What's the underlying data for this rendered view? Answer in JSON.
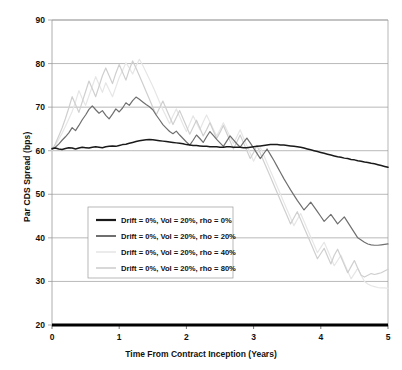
{
  "title": "",
  "axes": {
    "ylabel": "Par CDS Spread (bps)",
    "xlabel": "Time From Contract Inception (Years)",
    "yticks": [
      "90",
      "80",
      "70",
      "60",
      "50",
      "40",
      "30",
      "20"
    ],
    "xticks": [
      "0",
      "1",
      "2",
      "3",
      "4",
      "5"
    ]
  },
  "legend": {
    "items": [
      {
        "label": "Drift = 0%, Vol = 20%, rho = 0%",
        "color": "#1a1a1a"
      },
      {
        "label": "Drift = 0%, Vol = 20%, rho = 20%",
        "color": "#6f6f6f"
      },
      {
        "label": "Drift = 0%, Vol = 20%, rho = 40%",
        "color": "#e6e6e6"
      },
      {
        "label": "Drift = 0%, Vol = 20%, rho = 80%",
        "color": "#cfcfcf"
      }
    ]
  },
  "colors": {
    "grid": "#9a9a9a",
    "frame": "#9a9a9a",
    "axis": "#000000",
    "legend_border": "#9a9a9a",
    "background": "#ffffff"
  },
  "chart_data": {
    "type": "line",
    "title": "",
    "xlabel": "Time From Contract Inception (Years)",
    "ylabel": "Par CDS Spread (bps)",
    "xlim": [
      0,
      5
    ],
    "ylim": [
      20,
      90
    ],
    "grid": true,
    "legend_position": "center-left",
    "x": [
      0,
      0.05,
      0.1,
      0.15,
      0.2,
      0.25,
      0.3,
      0.35,
      0.4,
      0.45,
      0.5,
      0.55,
      0.6,
      0.65,
      0.7,
      0.75,
      0.8,
      0.85,
      0.9,
      0.95,
      1,
      1.05,
      1.1,
      1.15,
      1.2,
      1.25,
      1.3,
      1.35,
      1.4,
      1.45,
      1.5,
      1.55,
      1.6,
      1.65,
      1.7,
      1.75,
      1.8,
      1.85,
      1.9,
      1.95,
      2,
      2.05,
      2.1,
      2.15,
      2.2,
      2.25,
      2.3,
      2.35,
      2.4,
      2.45,
      2.5,
      2.55,
      2.6,
      2.65,
      2.7,
      2.75,
      2.8,
      2.85,
      2.9,
      2.95,
      3,
      3.05,
      3.1,
      3.15,
      3.2,
      3.25,
      3.3,
      3.35,
      3.4,
      3.45,
      3.5,
      3.55,
      3.6,
      3.65,
      3.7,
      3.75,
      3.8,
      3.85,
      3.9,
      3.95,
      4,
      4.05,
      4.1,
      4.15,
      4.2,
      4.25,
      4.3,
      4.35,
      4.4,
      4.45,
      4.5,
      4.55,
      4.6,
      4.65,
      4.7,
      4.75,
      4.8,
      4.85,
      4.9,
      4.95,
      5
    ],
    "series": [
      {
        "name": "Drift = 0%, Vol = 20%, rho = 0%",
        "color": "#1a1a1a",
        "values": [
          60.5,
          60.6,
          60.4,
          60.3,
          60.5,
          60.7,
          60.6,
          60.4,
          60.6,
          60.8,
          60.7,
          60.6,
          60.8,
          60.9,
          60.8,
          60.7,
          60.9,
          61.0,
          61.1,
          61.0,
          61.2,
          61.4,
          61.5,
          61.7,
          61.9,
          62.1,
          62.3,
          62.4,
          62.5,
          62.6,
          62.5,
          62.4,
          62.3,
          62.2,
          62.1,
          62.0,
          61.9,
          61.8,
          61.7,
          61.6,
          61.4,
          61.3,
          61.2,
          61.2,
          61.1,
          61.0,
          61.0,
          60.9,
          60.9,
          60.9,
          60.8,
          60.8,
          60.9,
          60.9,
          60.8,
          60.8,
          60.8,
          60.7,
          60.7,
          60.8,
          60.9,
          61.0,
          61.1,
          61.2,
          61.3,
          61.4,
          61.4,
          61.4,
          61.3,
          61.3,
          61.2,
          61.1,
          61.0,
          60.9,
          60.8,
          60.6,
          60.4,
          60.2,
          60.0,
          59.8,
          59.6,
          59.4,
          59.2,
          59.0,
          58.8,
          58.6,
          58.5,
          58.3,
          58.2,
          58.0,
          57.9,
          57.7,
          57.6,
          57.4,
          57.3,
          57.1,
          57.0,
          56.8,
          56.6,
          56.4,
          56.2
        ]
      },
      {
        "name": "Drift = 0%, Vol = 20%, rho = 20%",
        "color": "#6f6f6f",
        "values": [
          60.3,
          60.8,
          61.5,
          62.4,
          63.2,
          64.1,
          65.3,
          64.6,
          65.8,
          67.1,
          68.2,
          69.5,
          70.3,
          69.4,
          68.6,
          69.2,
          68.1,
          67.3,
          68.4,
          69.6,
          68.9,
          69.8,
          71.0,
          70.4,
          71.5,
          72.3,
          71.8,
          71.2,
          70.6,
          70.1,
          69.4,
          68.2,
          67.1,
          66.0,
          65.2,
          64.4,
          63.9,
          64.5,
          63.6,
          62.8,
          62.0,
          61.3,
          62.4,
          63.6,
          62.8,
          61.9,
          63.2,
          64.4,
          63.5,
          62.6,
          61.8,
          61.0,
          62.2,
          63.4,
          62.5,
          61.6,
          60.8,
          61.9,
          62.9,
          61.8,
          60.6,
          59.4,
          58.2,
          59.3,
          60.4,
          59.1,
          57.8,
          56.4,
          55.0,
          53.6,
          52.3,
          51.0,
          49.8,
          48.6,
          47.5,
          46.4,
          47.3,
          48.2,
          47.1,
          46.0,
          44.9,
          43.8,
          44.6,
          45.4,
          44.3,
          43.2,
          44.0,
          44.8,
          43.6,
          42.4,
          41.2,
          40.0,
          39.5,
          39.0,
          38.6,
          38.4,
          38.3,
          38.3,
          38.4,
          38.5,
          38.6
        ]
      },
      {
        "name": "Drift = 0%, Vol = 20%, rho = 40%",
        "color": "#e6e6e6",
        "values": [
          60.0,
          61.2,
          62.6,
          64.0,
          65.6,
          67.3,
          69.0,
          71.2,
          73.8,
          72.0,
          70.4,
          72.6,
          74.8,
          77.0,
          75.2,
          73.4,
          75.6,
          74.0,
          72.4,
          74.6,
          76.8,
          78.4,
          80.2,
          79.0,
          77.6,
          79.4,
          81.0,
          79.6,
          78.0,
          76.4,
          74.8,
          73.0,
          71.2,
          69.4,
          67.8,
          66.2,
          68.0,
          69.6,
          67.8,
          66.0,
          64.4,
          66.2,
          68.0,
          66.4,
          64.8,
          66.6,
          68.2,
          66.6,
          65.0,
          63.4,
          64.8,
          66.4,
          64.8,
          63.2,
          61.6,
          63.2,
          64.8,
          63.0,
          61.2,
          59.4,
          57.6,
          59.2,
          60.8,
          59.0,
          57.2,
          55.4,
          53.6,
          51.8,
          50.0,
          48.2,
          46.4,
          44.6,
          42.8,
          44.2,
          45.6,
          43.8,
          42.0,
          40.2,
          38.4,
          36.6,
          37.8,
          39.0,
          37.2,
          35.4,
          33.6,
          34.8,
          36.0,
          34.2,
          32.4,
          30.6,
          31.8,
          33.0,
          31.4,
          30.0,
          29.4,
          29.0,
          28.8,
          28.6,
          28.5,
          28.5,
          28.4
        ]
      },
      {
        "name": "Drift = 0%, Vol = 20%, rho = 80%",
        "color": "#cfcfcf",
        "values": [
          60.1,
          61.6,
          63.4,
          65.2,
          67.4,
          69.8,
          72.4,
          70.6,
          68.8,
          71.2,
          73.6,
          76.0,
          74.2,
          72.4,
          74.8,
          77.2,
          79.0,
          77.2,
          75.4,
          77.8,
          79.8,
          78.0,
          76.2,
          78.6,
          80.6,
          79.0,
          77.2,
          75.4,
          73.6,
          71.8,
          70.0,
          68.2,
          69.8,
          71.4,
          69.6,
          67.8,
          66.0,
          67.6,
          69.2,
          67.4,
          65.6,
          63.8,
          65.4,
          67.0,
          65.2,
          63.4,
          64.8,
          66.4,
          64.6,
          62.8,
          64.2,
          65.8,
          64.0,
          62.2,
          60.4,
          62.0,
          63.6,
          61.8,
          60.0,
          58.2,
          59.6,
          61.2,
          59.4,
          57.6,
          55.8,
          54.0,
          52.2,
          50.4,
          48.6,
          46.8,
          45.0,
          43.2,
          44.6,
          46.0,
          44.2,
          42.4,
          40.6,
          38.8,
          37.0,
          35.2,
          36.4,
          37.6,
          35.8,
          34.0,
          36.0,
          37.4,
          35.6,
          33.8,
          32.0,
          33.4,
          34.8,
          33.0,
          31.4,
          31.0,
          31.4,
          31.8,
          31.6,
          31.8,
          32.0,
          32.4,
          32.8
        ]
      }
    ]
  }
}
